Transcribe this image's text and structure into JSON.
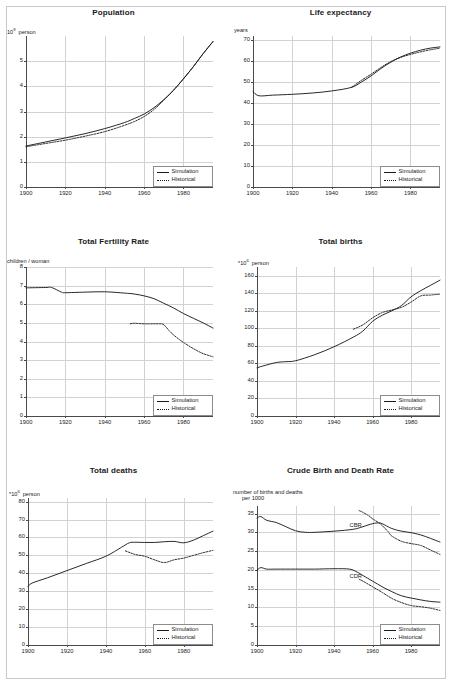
{
  "figure": {
    "legend_simulation": "Simulation",
    "legend_historical": "Historical"
  },
  "chart_data": [
    {
      "type": "line",
      "title": "Population",
      "ylabel": "10⁹ person",
      "ylabel_prefix": "10",
      "ylabel_sup": "9",
      "ylabel_suffix": "person",
      "xlabel": "",
      "xlim": [
        1900,
        1995
      ],
      "ylim": [
        0,
        6
      ],
      "yticks": [
        0,
        1,
        2,
        3,
        4,
        5
      ],
      "ytick_labels": [
        "0",
        "1",
        "2",
        "3",
        "4",
        "5"
      ],
      "xticks": [
        1900,
        1920,
        1940,
        1960,
        1980
      ],
      "xtick_labels": [
        "1900",
        "1920",
        "1940",
        "1960",
        "1980"
      ],
      "grid": true,
      "legend_position": "bottom-right",
      "series": [
        {
          "name": "Simulation",
          "style": "solid",
          "x": [
            1900,
            1910,
            1920,
            1930,
            1940,
            1950,
            1955,
            1960,
            1965,
            1970,
            1975,
            1980,
            1985,
            1990,
            1995
          ],
          "values": [
            1.63,
            1.79,
            1.95,
            2.12,
            2.32,
            2.56,
            2.72,
            2.9,
            3.15,
            3.47,
            3.85,
            4.3,
            4.78,
            5.3,
            5.78
          ]
        },
        {
          "name": "Historical",
          "style": "dotted",
          "x": [
            1900,
            1910,
            1920,
            1930,
            1940,
            1950,
            1955,
            1960,
            1965,
            1970,
            1975,
            1980,
            1985,
            1990,
            1995
          ],
          "values": [
            1.6,
            1.73,
            1.86,
            2.02,
            2.2,
            2.45,
            2.6,
            2.8,
            3.08,
            3.45,
            3.85,
            4.3,
            4.78,
            5.3,
            5.78
          ]
        }
      ]
    },
    {
      "type": "line",
      "title": "Life expectancy",
      "ylabel": "years",
      "xlabel": "",
      "xlim": [
        1900,
        1995
      ],
      "ylim": [
        0,
        72
      ],
      "yticks": [
        0,
        10,
        20,
        30,
        40,
        50,
        60,
        70
      ],
      "ytick_labels": [
        "0",
        "10",
        "20",
        "30",
        "40",
        "50",
        "60",
        "70"
      ],
      "xticks": [
        1900,
        1920,
        1940,
        1960,
        1980
      ],
      "xtick_labels": [
        "1900",
        "1920",
        "1940",
        "1960",
        "1980"
      ],
      "grid": true,
      "legend_position": "bottom-right",
      "series": [
        {
          "name": "Simulation",
          "style": "solid",
          "x": [
            1900,
            1903,
            1910,
            1920,
            1930,
            1940,
            1950,
            1955,
            1960,
            1965,
            1970,
            1975,
            1980,
            1985,
            1990,
            1995
          ],
          "values": [
            45.5,
            43.5,
            43.8,
            44.2,
            44.8,
            45.8,
            47.5,
            50.0,
            53.0,
            56.5,
            59.5,
            62.0,
            63.8,
            65.2,
            66.2,
            66.8
          ]
        },
        {
          "name": "Historical",
          "style": "dotted",
          "x": [
            1950,
            1955,
            1960,
            1965,
            1970,
            1975,
            1980,
            1985,
            1990,
            1995
          ],
          "values": [
            47.5,
            50.8,
            53.8,
            57.0,
            59.8,
            61.8,
            63.2,
            64.4,
            65.4,
            66.2
          ]
        }
      ]
    },
    {
      "type": "line",
      "title": "Total Fertility Rate",
      "ylabel": "children / woman",
      "xlabel": "",
      "xlim": [
        1900,
        1995
      ],
      "ylim": [
        0,
        8
      ],
      "yticks": [
        0,
        1,
        2,
        3,
        4,
        5,
        6,
        7,
        8
      ],
      "ytick_labels": [
        "0",
        "1",
        "2",
        "3",
        "4",
        "5",
        "6",
        "7",
        "8"
      ],
      "xticks": [
        1900,
        1920,
        1940,
        1960,
        1980
      ],
      "xtick_labels": [
        "1900",
        "1920",
        "1940",
        "1960",
        "1980"
      ],
      "grid": true,
      "legend_position": "bottom-right",
      "series": [
        {
          "name": "Simulation",
          "style": "solid",
          "x": [
            1900,
            1910,
            1913,
            1918,
            1920,
            1930,
            1940,
            1950,
            1955,
            1960,
            1965,
            1970,
            1975,
            1980,
            1985,
            1990,
            1995
          ],
          "values": [
            6.88,
            6.9,
            6.9,
            6.65,
            6.62,
            6.65,
            6.67,
            6.6,
            6.55,
            6.45,
            6.3,
            6.05,
            5.8,
            5.5,
            5.25,
            5.0,
            4.72
          ]
        },
        {
          "name": "Historical",
          "style": "dotted",
          "x": [
            1953,
            1955,
            1960,
            1965,
            1968,
            1970,
            1973,
            1975,
            1978,
            1980,
            1985,
            1990,
            1995
          ],
          "values": [
            4.95,
            4.98,
            4.95,
            4.95,
            4.95,
            4.9,
            4.55,
            4.35,
            4.1,
            3.95,
            3.62,
            3.35,
            3.18
          ]
        }
      ]
    },
    {
      "type": "line",
      "title": "Total births",
      "ylabel": "*10⁶ person",
      "ylabel_prefix": "*10",
      "ylabel_sup": "6",
      "ylabel_suffix": "person",
      "xlabel": "",
      "xlim": [
        1900,
        1995
      ],
      "ylim": [
        0,
        170
      ],
      "yticks": [
        0,
        20,
        40,
        60,
        80,
        100,
        120,
        140,
        160
      ],
      "ytick_labels": [
        "0",
        "20",
        "40",
        "60",
        "80",
        "100",
        "120",
        "140",
        "160"
      ],
      "xticks": [
        1900,
        1920,
        1940,
        1960,
        1980
      ],
      "xtick_labels": [
        "1900",
        "1920",
        "1940",
        "1960",
        "1980"
      ],
      "grid": true,
      "legend_position": "bottom-right",
      "series": [
        {
          "name": "Simulation",
          "style": "solid",
          "x": [
            1900,
            1903,
            1910,
            1915,
            1920,
            1930,
            1940,
            1950,
            1955,
            1960,
            1965,
            1970,
            1975,
            1980,
            1985,
            1990,
            1995
          ],
          "values": [
            55,
            57,
            61,
            62,
            63,
            70,
            79,
            90,
            97,
            108,
            115,
            120,
            126,
            136,
            143,
            149,
            155
          ]
        },
        {
          "name": "Historical",
          "style": "dotted",
          "x": [
            1950,
            1955,
            1960,
            1965,
            1970,
            1975,
            1980,
            1985,
            1990,
            1995
          ],
          "values": [
            99,
            104,
            112,
            118,
            121,
            124,
            130,
            137,
            138,
            139
          ]
        }
      ]
    },
    {
      "type": "line",
      "title": "Total deaths",
      "ylabel": "*10⁶ person",
      "ylabel_prefix": "*10",
      "ylabel_sup": "6",
      "ylabel_suffix": "person",
      "xlabel": "",
      "xlim": [
        1900,
        1995
      ],
      "ylim": [
        0,
        82
      ],
      "yticks": [
        0,
        10,
        20,
        30,
        40,
        50,
        60,
        70,
        80
      ],
      "ytick_labels": [
        "0",
        "10",
        "20",
        "30",
        "40",
        "50",
        "60",
        "70",
        "80"
      ],
      "xticks": [
        1900,
        1920,
        1940,
        1960,
        1980
      ],
      "xtick_labels": [
        "1900",
        "1920",
        "1940",
        "1960",
        "1980"
      ],
      "grid": true,
      "legend_position": "bottom-right",
      "series": [
        {
          "name": "Simulation",
          "style": "solid",
          "x": [
            1900,
            1902,
            1910,
            1920,
            1930,
            1940,
            1948,
            1952,
            1955,
            1960,
            1965,
            1970,
            1975,
            1980,
            1985,
            1990,
            1995
          ],
          "values": [
            32.5,
            34.5,
            37.5,
            41.5,
            45.5,
            49.5,
            54.5,
            57.0,
            57.3,
            57.2,
            57.2,
            57.6,
            57.8,
            57.0,
            58.5,
            61.0,
            63.5
          ]
        },
        {
          "name": "Historical",
          "style": "dotted",
          "x": [
            1950,
            1955,
            1960,
            1965,
            1970,
            1975,
            1980,
            1985,
            1990,
            1995
          ],
          "values": [
            52.5,
            50.5,
            49.5,
            47.5,
            46.0,
            47.5,
            48.5,
            50.0,
            51.5,
            52.8
          ]
        }
      ]
    },
    {
      "type": "line",
      "title": "Crude Birth and Death Rate",
      "ylabel": "number of births and deaths per 1000",
      "ylabel_line1": "number of births and deaths",
      "ylabel_line2": "per 1000",
      "xlabel": "",
      "xlim": [
        1900,
        1995
      ],
      "ylim": [
        0,
        37
      ],
      "yticks": [
        0,
        5,
        10,
        15,
        20,
        25,
        30,
        35
      ],
      "ytick_labels": [
        "0",
        "5",
        "10",
        "15",
        "20",
        "25",
        "30",
        "35"
      ],
      "xticks": [
        1900,
        1920,
        1940,
        1960,
        1980
      ],
      "xtick_labels": [
        "1900",
        "1920",
        "1940",
        "1960",
        "1980"
      ],
      "grid": true,
      "legend_position": "bottom-right",
      "annotations": [
        {
          "text": "CBR",
          "x": 1948,
          "y": 31.8
        },
        {
          "text": "CDR",
          "x": 1948,
          "y": 18.0
        }
      ],
      "series": [
        {
          "name": "CBR Simulation",
          "style": "solid",
          "x": [
            1900,
            1902,
            1905,
            1910,
            1915,
            1920,
            1925,
            1930,
            1940,
            1950,
            1955,
            1960,
            1963,
            1965,
            1970,
            1975,
            1980,
            1985,
            1990,
            1995
          ],
          "values": [
            33.8,
            34.2,
            33.2,
            32.6,
            31.5,
            30.4,
            30.0,
            30.0,
            30.3,
            30.8,
            31.5,
            32.3,
            32.5,
            32.3,
            31.0,
            30.3,
            29.9,
            29.3,
            28.4,
            27.4
          ]
        },
        {
          "name": "CBR Historical",
          "style": "dotted",
          "x": [
            1953,
            1955,
            1958,
            1960,
            1963,
            1965,
            1968,
            1970,
            1975,
            1980,
            1985,
            1990,
            1995
          ],
          "values": [
            35.8,
            35.3,
            34.4,
            33.6,
            32.6,
            31.8,
            30.2,
            29.0,
            27.6,
            27.0,
            26.5,
            25.3,
            24.1
          ]
        },
        {
          "name": "CDR Simulation",
          "style": "solid",
          "x": [
            1900,
            1902,
            1905,
            1910,
            1920,
            1930,
            1940,
            1948,
            1952,
            1955,
            1960,
            1965,
            1970,
            1975,
            1980,
            1985,
            1990,
            1995
          ],
          "values": [
            19.9,
            20.6,
            20.2,
            20.2,
            20.2,
            20.2,
            20.3,
            20.2,
            19.4,
            18.5,
            17.0,
            15.5,
            14.2,
            13.1,
            12.5,
            12.0,
            11.6,
            11.4
          ]
        },
        {
          "name": "CDR Historical",
          "style": "dotted",
          "x": [
            1953,
            1955,
            1960,
            1965,
            1970,
            1975,
            1980,
            1985,
            1990,
            1995
          ],
          "values": [
            17.5,
            17.0,
            15.5,
            14.0,
            12.4,
            11.3,
            10.5,
            10.2,
            9.8,
            9.2
          ]
        }
      ]
    }
  ]
}
